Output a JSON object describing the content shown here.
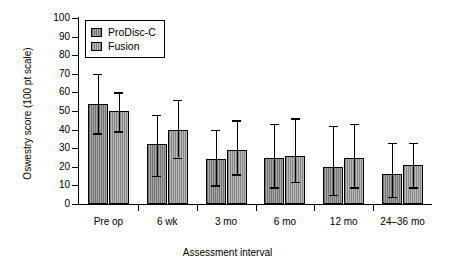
{
  "chart_data": {
    "type": "bar",
    "title": "",
    "xlabel": "Assessment interval",
    "ylabel": "Oswestry score (100 pt scale)",
    "categories": [
      "Pre op",
      "6 wk",
      "3 mo",
      "6 mo",
      "12 mo",
      "24–36 mo"
    ],
    "ylim": [
      0,
      100
    ],
    "yticks": [
      0,
      10,
      20,
      30,
      40,
      50,
      60,
      70,
      80,
      90,
      100
    ],
    "ytick_labels": [
      "0",
      "10",
      "20",
      "30",
      "40",
      "50",
      "60",
      "70",
      "80",
      "90",
      "100"
    ],
    "grid": false,
    "legend_position": "top-left",
    "error_bars": "asymmetric",
    "series": [
      {
        "name": "ProDisc-C",
        "color": "#8f8f8f",
        "values": [
          54,
          32,
          24,
          25,
          20,
          16
        ],
        "err_low": [
          38,
          15,
          10,
          9,
          5,
          4
        ],
        "err_high": [
          70,
          48,
          40,
          43,
          42,
          33
        ]
      },
      {
        "name": "Fusion",
        "color": "#a6a6a6",
        "values": [
          50,
          40,
          29,
          26,
          25,
          21
        ],
        "err_low": [
          39,
          25,
          16,
          12,
          9,
          9
        ],
        "err_high": [
          60,
          56,
          45,
          46,
          43,
          33
        ]
      }
    ]
  },
  "axis": {
    "y_title": "Oswestry score (100 pt scale)",
    "x_title": "Assessment interval"
  },
  "legend": {
    "items": [
      {
        "label": "ProDisc-C"
      },
      {
        "label": "Fusion"
      }
    ]
  }
}
